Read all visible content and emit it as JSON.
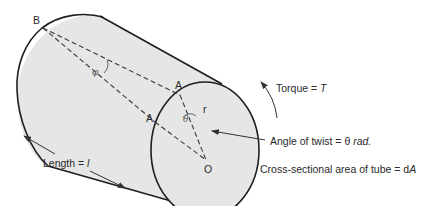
{
  "figure": {
    "type": "thin-walled tube under torsion",
    "points": {
      "B": "B",
      "A_upper": "A",
      "A_lower": "A",
      "O": "O"
    },
    "symbols": {
      "phi": "φ",
      "theta": "θ",
      "radius": "r"
    },
    "labels": {
      "torque_prefix": "Torque = ",
      "torque_symbol": "T",
      "twist_prefix": "Angle of twist = θ ",
      "twist_unit": "rad.",
      "area_prefix": "Cross-sectional area of tube = d",
      "area_symbol": "A",
      "length_prefix": "Length = ",
      "length_symbol": "l"
    },
    "colors": {
      "tube_fill": "#e6e6e6",
      "outline": "#1e1e1e",
      "dashed": "#3a3a3a",
      "text": "#2a2a2a"
    }
  }
}
